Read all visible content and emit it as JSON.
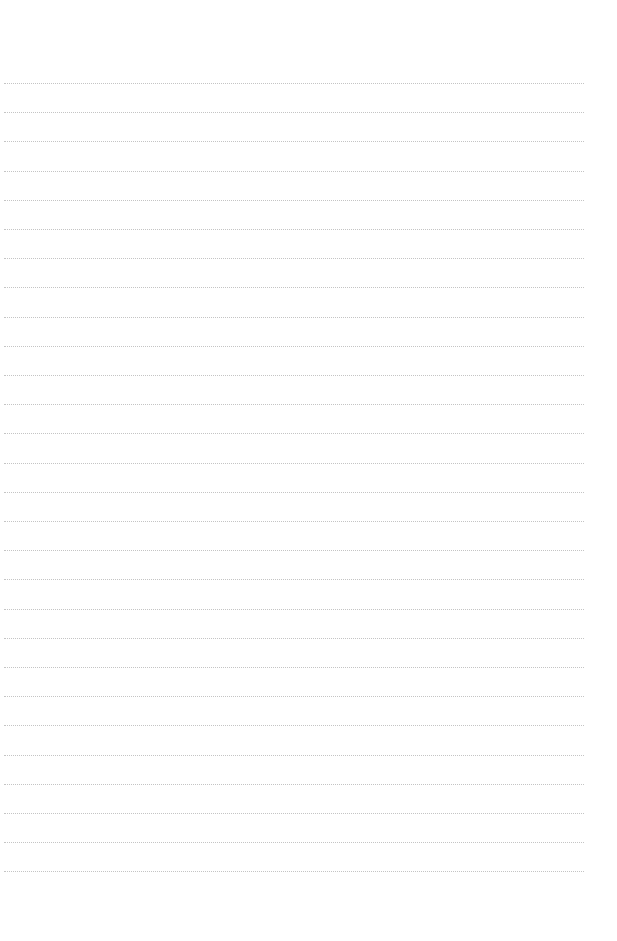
{
  "page": {
    "type": "blank-lined-sheet",
    "background_color": "#ffffff",
    "line_color": "#c4c4c4",
    "line_count": 28,
    "first_line_y": 83,
    "line_spacing": 29.2,
    "line_left": 4,
    "line_width": 580
  }
}
